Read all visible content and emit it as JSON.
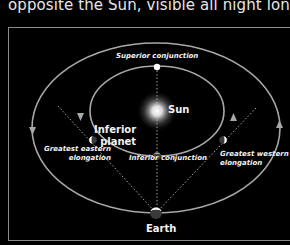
{
  "caption": "opposite the Sun, visible all night long.",
  "diagram": {
    "labels": {
      "superior_conjunction": "Superior conjunction",
      "sun": "Sun",
      "inferior_planet_line1": "Inferior",
      "inferior_planet_line2": "planet",
      "greatest_eastern_line1": "Greatest eastern",
      "greatest_eastern_line2": "elongation",
      "inferior_conjunction": "Inferior conjunction",
      "greatest_western_line1": "Greatest western",
      "greatest_western_line2": "elongation",
      "earth": "Earth"
    },
    "colors": {
      "background": "#000000",
      "orbit": "#a8a8a8",
      "text": "#f2f2f2",
      "frame": "#8a8a8a"
    }
  }
}
